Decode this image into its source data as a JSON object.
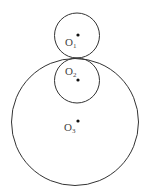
{
  "diagram": {
    "title": "",
    "circles": [
      {
        "id": "O1",
        "name": "O",
        "subscript": "1",
        "center": [
          77,
          35.5
        ],
        "radius": 22.5,
        "dot": [
          78,
          35
        ],
        "label_pos": [
          65,
          37
        ]
      },
      {
        "id": "O2",
        "name": "O",
        "subscript": "2",
        "center": [
          77,
          80.5
        ],
        "radius": 22.5,
        "dot": [
          78,
          80
        ],
        "label_pos": [
          65,
          66
        ]
      },
      {
        "id": "O3",
        "name": "O",
        "subscript": "3",
        "center": [
          75,
          122
        ],
        "radius": 63.5,
        "dot": [
          78,
          121
        ],
        "label_pos": [
          64,
          122
        ]
      }
    ],
    "relations": [
      "Circle O1 and circle O2 are externally tangent at point (77, 58)",
      "Circle O2 is internally tangent to circle O3 at point (77, 58)",
      "Circle O1 is externally tangent to circle O3 at point (77, 58)"
    ],
    "colors": {
      "stroke": "#333333",
      "dot": "#111111",
      "label": "#444444",
      "background": "#ffffff"
    }
  }
}
